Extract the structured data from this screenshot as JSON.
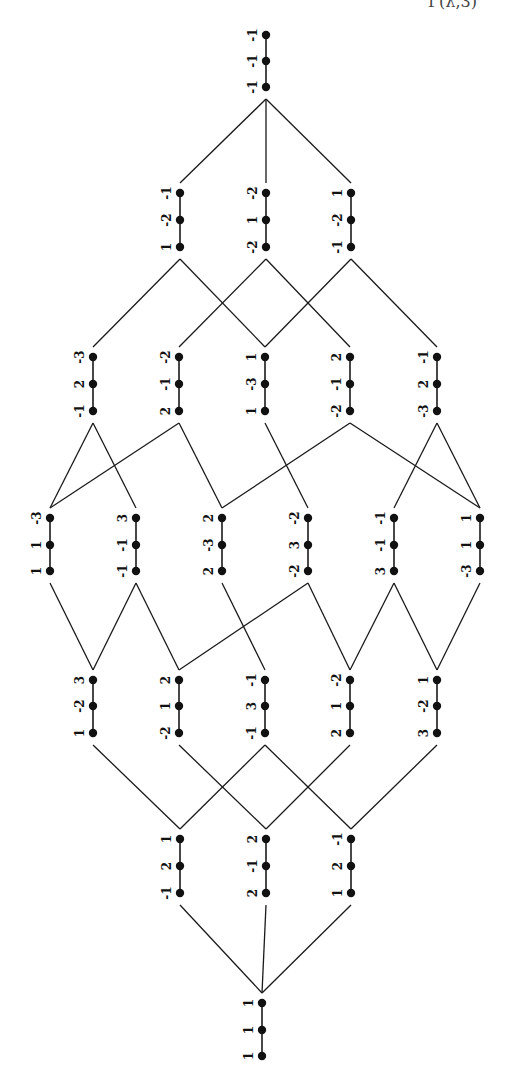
{
  "header_fragment": "Γ(λ,3)",
  "diagram": {
    "type": "lattice",
    "orientation": "rotated-90",
    "rows": [
      {
        "x": [
          266
        ],
        "y": [
          35,
          61,
          87
        ],
        "nodes": [
          [
            "-1",
            "-1",
            "-1"
          ]
        ]
      },
      {
        "x": [
          180,
          266,
          351
        ],
        "y": [
          193,
          220,
          247
        ],
        "nodes": [
          [
            "-1",
            "-2",
            "1"
          ],
          [
            "-2",
            "1",
            "-2"
          ],
          [
            "1",
            "-2",
            "-1"
          ]
        ]
      },
      {
        "x": [
          93,
          179,
          265,
          350,
          437
        ],
        "y": [
          357,
          384,
          411
        ],
        "nodes": [
          [
            "-3",
            "2",
            "-1"
          ],
          [
            "-2",
            "-1",
            "2"
          ],
          [
            "1",
            "-3",
            "1"
          ],
          [
            "2",
            "-1",
            "-2"
          ],
          [
            "-1",
            "2",
            "-3"
          ]
        ]
      },
      {
        "x": [
          50,
          136,
          222,
          308,
          394,
          480
        ],
        "y": [
          518,
          545,
          571
        ],
        "nodes": [
          [
            "-3",
            "1",
            "1"
          ],
          [
            "3",
            "-1",
            "-1"
          ],
          [
            "2",
            "-3",
            "2"
          ],
          [
            "-2",
            "3",
            "-2"
          ],
          [
            "-1",
            "-1",
            "3"
          ],
          [
            "1",
            "1",
            "-3"
          ]
        ]
      },
      {
        "x": [
          93,
          179,
          265,
          350,
          437
        ],
        "y": [
          680,
          706,
          733
        ],
        "nodes": [
          [
            "3",
            "-2",
            "1"
          ],
          [
            "2",
            "1",
            "-2"
          ],
          [
            "-1",
            "3",
            "-1"
          ],
          [
            "-2",
            "1",
            "2"
          ],
          [
            "1",
            "-2",
            "3"
          ]
        ]
      },
      {
        "x": [
          180,
          266,
          351
        ],
        "y": [
          839,
          866,
          893
        ],
        "nodes": [
          [
            "1",
            "2",
            "-1"
          ],
          [
            "2",
            "-1",
            "2"
          ],
          [
            "-1",
            "2",
            "1"
          ]
        ]
      },
      {
        "x": [
          262
        ],
        "y": [
          1003,
          1030,
          1056
        ],
        "nodes": [
          [
            "1",
            "1",
            "1"
          ]
        ]
      }
    ],
    "edges": [
      [
        [
          0,
          0
        ],
        [
          1,
          0
        ]
      ],
      [
        [
          0,
          0
        ],
        [
          1,
          1
        ]
      ],
      [
        [
          0,
          0
        ],
        [
          1,
          2
        ]
      ],
      [
        [
          1,
          0
        ],
        [
          2,
          0
        ]
      ],
      [
        [
          1,
          0
        ],
        [
          2,
          2
        ]
      ],
      [
        [
          1,
          1
        ],
        [
          2,
          1
        ]
      ],
      [
        [
          1,
          1
        ],
        [
          2,
          3
        ]
      ],
      [
        [
          1,
          2
        ],
        [
          2,
          2
        ]
      ],
      [
        [
          1,
          2
        ],
        [
          2,
          4
        ]
      ],
      [
        [
          2,
          0
        ],
        [
          3,
          0
        ]
      ],
      [
        [
          2,
          0
        ],
        [
          3,
          1
        ]
      ],
      [
        [
          2,
          1
        ],
        [
          3,
          0
        ]
      ],
      [
        [
          2,
          1
        ],
        [
          3,
          2
        ]
      ],
      [
        [
          2,
          2
        ],
        [
          3,
          3
        ]
      ],
      [
        [
          2,
          3
        ],
        [
          3,
          2
        ]
      ],
      [
        [
          2,
          3
        ],
        [
          3,
          5
        ]
      ],
      [
        [
          2,
          4
        ],
        [
          3,
          4
        ]
      ],
      [
        [
          2,
          4
        ],
        [
          3,
          5
        ]
      ],
      [
        [
          3,
          0
        ],
        [
          4,
          0
        ]
      ],
      [
        [
          3,
          1
        ],
        [
          4,
          0
        ]
      ],
      [
        [
          3,
          1
        ],
        [
          4,
          1
        ]
      ],
      [
        [
          3,
          2
        ],
        [
          4,
          2
        ]
      ],
      [
        [
          3,
          3
        ],
        [
          4,
          1
        ]
      ],
      [
        [
          3,
          3
        ],
        [
          4,
          3
        ]
      ],
      [
        [
          3,
          4
        ],
        [
          4,
          3
        ]
      ],
      [
        [
          3,
          4
        ],
        [
          4,
          4
        ]
      ],
      [
        [
          3,
          5
        ],
        [
          4,
          4
        ]
      ],
      [
        [
          4,
          0
        ],
        [
          5,
          0
        ]
      ],
      [
        [
          4,
          1
        ],
        [
          5,
          1
        ]
      ],
      [
        [
          4,
          2
        ],
        [
          5,
          0
        ]
      ],
      [
        [
          4,
          2
        ],
        [
          5,
          2
        ]
      ],
      [
        [
          4,
          3
        ],
        [
          5,
          1
        ]
      ],
      [
        [
          4,
          4
        ],
        [
          5,
          2
        ]
      ],
      [
        [
          5,
          0
        ],
        [
          6,
          0
        ]
      ],
      [
        [
          5,
          1
        ],
        [
          6,
          0
        ]
      ],
      [
        [
          5,
          2
        ],
        [
          6,
          0
        ]
      ]
    ]
  }
}
